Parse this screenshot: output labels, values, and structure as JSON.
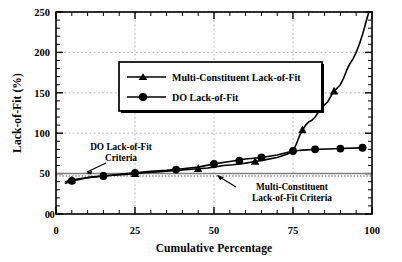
{
  "chart_data": {
    "type": "line",
    "title": "",
    "xlabel": "Cumulative Percentage",
    "ylabel": "Lack-of-Fit (%)",
    "xlim": [
      0,
      100
    ],
    "ylim": [
      0,
      250
    ],
    "xticks": [
      "0",
      "25",
      "50",
      "75",
      "100"
    ],
    "xtick_values": [
      0,
      25,
      50,
      75,
      100
    ],
    "yticks": [
      "0",
      "50",
      "100",
      "150",
      "200",
      "250"
    ],
    "ytick_values": [
      0,
      50,
      100,
      150,
      200,
      250
    ],
    "grid": true,
    "grid_style": "dotted",
    "legend_position": "upper-left-inside",
    "series": [
      {
        "name": "Multi-Constituent Lack-of-Fit",
        "marker": "triangle",
        "color": "#000000",
        "x": [
          3,
          5,
          8,
          12,
          15,
          18,
          22,
          25,
          28,
          32,
          35,
          38,
          42,
          45,
          48,
          50,
          53,
          56,
          60,
          63,
          66,
          70,
          73,
          75,
          76,
          77,
          78,
          79,
          80,
          81,
          82,
          83,
          84,
          85,
          86,
          87,
          88,
          89,
          90,
          91,
          92,
          93,
          94,
          95,
          96,
          97,
          98,
          99
        ],
        "y": [
          40,
          42,
          44,
          46,
          47,
          48,
          49,
          50,
          51,
          52,
          53,
          54,
          55,
          56,
          57,
          58,
          60,
          61,
          63,
          65,
          67,
          70,
          74,
          78,
          86,
          96,
          104,
          110,
          114,
          116,
          120,
          126,
          131,
          135,
          139,
          146,
          152,
          156,
          160,
          168,
          178,
          186,
          192,
          200,
          210,
          222,
          236,
          250
        ],
        "marker_x": [
          5,
          25,
          45,
          63,
          78,
          88
        ],
        "marker_y": [
          42,
          50,
          56,
          65,
          104,
          152
        ]
      },
      {
        "name": "DO Lack-of-Fit",
        "marker": "circle",
        "color": "#000000",
        "x": [
          3,
          5,
          10,
          15,
          20,
          25,
          30,
          35,
          40,
          45,
          50,
          55,
          60,
          65,
          70,
          75,
          78,
          82,
          86,
          90,
          94,
          98
        ],
        "y": [
          38,
          41,
          45,
          47,
          49,
          51,
          53,
          54,
          56,
          58,
          62,
          65,
          68,
          70,
          73,
          78,
          79,
          80,
          80.5,
          81,
          81.5,
          82
        ],
        "marker_x": [
          5,
          15,
          25,
          38,
          50,
          58,
          65,
          75,
          82,
          90,
          97
        ],
        "marker_y": [
          41,
          47,
          51,
          55,
          62,
          66,
          70,
          78,
          80,
          81,
          82
        ]
      }
    ],
    "reference_lines": [
      {
        "name": "DO Lack-of-Fit Criteria",
        "label": "DO Lack-of-Fit\nCriteria",
        "label_line1": "DO Lack-of-Fit",
        "label_line2": "Criteria",
        "value": 50,
        "style": "solid",
        "color": "#808080"
      },
      {
        "name": "Multi-Constituent Lack-of-Fit Criteria",
        "label_line1": "Multi-Constituent",
        "label_line2": "Lack-of-Fit Criteria",
        "value": 47,
        "style": "dotted",
        "color": "#555555"
      }
    ]
  },
  "axes": {
    "xlabel": "Cumulative Percentage",
    "ylabel": "Lack-of-Fit (%)",
    "xticks": [
      "0",
      "25",
      "50",
      "75",
      "100"
    ],
    "yticks": [
      "250",
      "200",
      "150",
      "100",
      "50",
      "0"
    ],
    "x_origin_label": "0"
  },
  "legend": {
    "items": [
      {
        "label": "Multi-Constituent Lack-of-Fit",
        "marker": "triangle"
      },
      {
        "label": "DO Lack-of-Fit",
        "marker": "circle"
      }
    ]
  },
  "annotations": {
    "do_criteria": {
      "line1": "DO Lack-of-Fit",
      "line2": "Criteria"
    },
    "mc_criteria": {
      "line1": "Multi-Constituent",
      "line2": "Lack-of-Fit Criteria"
    }
  },
  "colors": {
    "series": "#000000",
    "grid": "#9a9a9a",
    "do_criteria_line": "#8c8c8c",
    "mc_criteria_line": "#4d4d4d",
    "frame": "#000000",
    "background": "#ffffff"
  }
}
